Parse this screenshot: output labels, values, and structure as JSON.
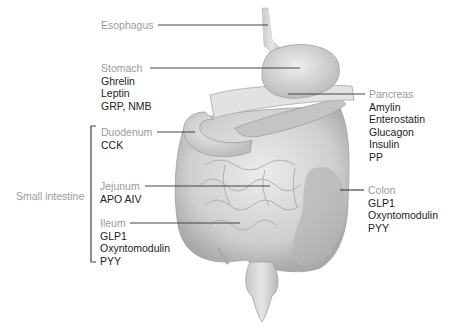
{
  "diagram": {
    "type": "anatomical-illustration",
    "colors": {
      "organ_label": "#9a9a9a",
      "hormone_label": "#222222",
      "leader_line": "#444444",
      "organ_fill": "#d4d4d4"
    }
  },
  "labels": {
    "esophagus": {
      "name": "Esophagus",
      "hormones": []
    },
    "stomach": {
      "name": "Stomach",
      "hormones": [
        "Ghrelin",
        "Leptin",
        "GRP, NMB"
      ]
    },
    "pancreas": {
      "name": "Pancreas",
      "hormones": [
        "Amylin",
        "Enterostatin",
        "Glucagon",
        "Insulin",
        "PP"
      ]
    },
    "duodenum": {
      "name": "Duodenum",
      "hormones": [
        "CCK"
      ]
    },
    "jejunum": {
      "name": "Jejunum",
      "hormones": [
        "APO AIV"
      ]
    },
    "ileum": {
      "name": "Ileum",
      "hormones": [
        "GLP1",
        "Oxyntomodulin",
        "PYY"
      ]
    },
    "colon": {
      "name": "Colon",
      "hormones": [
        "GLP1",
        "Oxyntomodulin",
        "PYY"
      ]
    },
    "small_intestine": {
      "name": "Small intestine"
    }
  }
}
